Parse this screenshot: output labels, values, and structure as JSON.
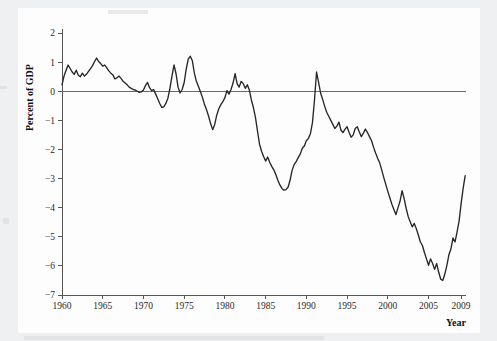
{
  "figure": {
    "background_color": "#eff0f1",
    "plot_background_color": "#fdfdfd",
    "line_color": "#262626",
    "axis_color": "#555555",
    "zero_line_color": "#6b6b6b",
    "text_color": "#1a1a1a"
  },
  "chart_data": {
    "type": "line",
    "title": "",
    "subtitle": "",
    "xlabel": "Year",
    "ylabel": "Percent of GDP",
    "xlim": [
      1960,
      2009.6
    ],
    "ylim": [
      -7,
      2
    ],
    "grid": false,
    "legend": null,
    "zero_reference_line": 0,
    "xticks": [
      1960,
      1965,
      1970,
      1975,
      1980,
      1985,
      1990,
      1995,
      2000,
      2005,
      2009
    ],
    "xtick_labels": [
      "1960",
      "1965",
      "1970",
      "1975",
      "1980",
      "1985",
      "1990",
      "1995",
      "2000",
      "2005",
      "2009"
    ],
    "yticks": [
      2,
      1,
      0,
      -1,
      -2,
      -3,
      -4,
      -5,
      -6,
      -7
    ],
    "ytick_labels": [
      "2",
      "1",
      "0",
      "−1",
      "−2",
      "−3",
      "−4",
      "−5",
      "−6",
      "−7"
    ],
    "series": [
      {
        "name": "Current account balance",
        "x": [
          1960.0,
          1960.25,
          1960.5,
          1960.75,
          1961.0,
          1961.25,
          1961.5,
          1961.75,
          1962.0,
          1962.25,
          1962.5,
          1962.75,
          1963.0,
          1963.25,
          1963.5,
          1963.75,
          1964.0,
          1964.25,
          1964.5,
          1964.75,
          1965.0,
          1965.25,
          1965.5,
          1965.75,
          1966.0,
          1966.25,
          1966.5,
          1966.75,
          1967.0,
          1967.25,
          1967.5,
          1967.75,
          1968.0,
          1968.25,
          1968.5,
          1968.75,
          1969.0,
          1969.25,
          1969.5,
          1969.75,
          1970.0,
          1970.25,
          1970.5,
          1970.75,
          1971.0,
          1971.25,
          1971.5,
          1971.75,
          1972.0,
          1972.25,
          1972.5,
          1972.75,
          1973.0,
          1973.25,
          1973.5,
          1973.75,
          1974.0,
          1974.25,
          1974.5,
          1974.75,
          1975.0,
          1975.25,
          1975.5,
          1975.75,
          1976.0,
          1976.25,
          1976.5,
          1976.75,
          1977.0,
          1977.25,
          1977.5,
          1977.75,
          1978.0,
          1978.25,
          1978.5,
          1978.75,
          1979.0,
          1979.25,
          1979.5,
          1979.75,
          1980.0,
          1980.25,
          1980.5,
          1980.75,
          1981.0,
          1981.25,
          1981.5,
          1981.75,
          1982.0,
          1982.25,
          1982.5,
          1982.75,
          1983.0,
          1983.25,
          1983.5,
          1983.75,
          1984.0,
          1984.25,
          1984.5,
          1984.75,
          1985.0,
          1985.25,
          1985.5,
          1985.75,
          1986.0,
          1986.25,
          1986.5,
          1986.75,
          1987.0,
          1987.25,
          1987.5,
          1987.75,
          1988.0,
          1988.25,
          1988.5,
          1988.75,
          1989.0,
          1989.25,
          1989.5,
          1989.75,
          1990.0,
          1990.25,
          1990.5,
          1990.75,
          1991.0,
          1991.25,
          1991.5,
          1991.75,
          1992.0,
          1992.25,
          1992.5,
          1992.75,
          1993.0,
          1993.25,
          1993.5,
          1993.75,
          1994.0,
          1994.25,
          1994.5,
          1994.75,
          1995.0,
          1995.25,
          1995.5,
          1995.75,
          1996.0,
          1996.25,
          1996.5,
          1996.75,
          1997.0,
          1997.25,
          1997.5,
          1997.75,
          1998.0,
          1998.25,
          1998.5,
          1998.75,
          1999.0,
          1999.25,
          1999.5,
          1999.75,
          2000.0,
          2000.25,
          2000.5,
          2000.75,
          2001.0,
          2001.25,
          2001.5,
          2001.75,
          2002.0,
          2002.25,
          2002.5,
          2002.75,
          2003.0,
          2003.25,
          2003.5,
          2003.75,
          2004.0,
          2004.25,
          2004.5,
          2004.75,
          2005.0,
          2005.25,
          2005.5,
          2005.75,
          2006.0,
          2006.25,
          2006.5,
          2006.75,
          2007.0,
          2007.25,
          2007.5,
          2007.75,
          2008.0,
          2008.25,
          2008.5,
          2008.75,
          2009.0,
          2009.25,
          2009.5
        ],
        "y": [
          0.22,
          0.52,
          0.72,
          0.9,
          0.78,
          0.66,
          0.58,
          0.72,
          0.55,
          0.5,
          0.62,
          0.52,
          0.58,
          0.68,
          0.78,
          0.88,
          1.02,
          1.14,
          1.02,
          0.95,
          0.86,
          0.9,
          0.8,
          0.7,
          0.62,
          0.56,
          0.42,
          0.46,
          0.52,
          0.44,
          0.34,
          0.28,
          0.22,
          0.14,
          0.1,
          0.06,
          0.04,
          0.0,
          -0.04,
          -0.02,
          0.04,
          0.2,
          0.3,
          0.12,
          0.02,
          0.06,
          -0.1,
          -0.26,
          -0.42,
          -0.56,
          -0.54,
          -0.42,
          -0.24,
          0.1,
          0.52,
          0.9,
          0.6,
          0.14,
          -0.06,
          0.06,
          0.3,
          0.76,
          1.1,
          1.2,
          1.05,
          0.62,
          0.34,
          0.16,
          -0.02,
          -0.22,
          -0.46,
          -0.64,
          -0.86,
          -1.12,
          -1.32,
          -1.14,
          -0.82,
          -0.6,
          -0.46,
          -0.36,
          -0.22,
          0.02,
          -0.1,
          0.06,
          0.28,
          0.6,
          0.26,
          0.14,
          0.34,
          0.26,
          0.1,
          0.22,
          0.04,
          -0.3,
          -0.56,
          -0.9,
          -1.36,
          -1.82,
          -2.06,
          -2.24,
          -2.4,
          -2.26,
          -2.44,
          -2.58,
          -2.7,
          -2.86,
          -3.06,
          -3.22,
          -3.34,
          -3.4,
          -3.38,
          -3.3,
          -3.06,
          -2.72,
          -2.52,
          -2.42,
          -2.28,
          -2.16,
          -1.96,
          -1.88,
          -1.7,
          -1.62,
          -1.46,
          -1.08,
          -0.3,
          0.66,
          0.3,
          -0.06,
          -0.28,
          -0.52,
          -0.72,
          -0.86,
          -1.0,
          -1.14,
          -1.28,
          -1.2,
          -1.06,
          -1.34,
          -1.42,
          -1.3,
          -1.22,
          -1.42,
          -1.58,
          -1.5,
          -1.28,
          -1.22,
          -1.4,
          -1.56,
          -1.44,
          -1.3,
          -1.42,
          -1.56,
          -1.7,
          -1.92,
          -2.12,
          -2.3,
          -2.46,
          -2.7,
          -2.96,
          -3.2,
          -3.44,
          -3.66,
          -3.88,
          -4.06,
          -4.24,
          -4.0,
          -3.78,
          -3.42,
          -3.68,
          -4.02,
          -4.3,
          -4.48,
          -4.66,
          -4.54,
          -4.72,
          -4.94,
          -5.18,
          -5.3,
          -5.54,
          -5.76,
          -5.98,
          -5.76,
          -5.92,
          -6.12,
          -5.92,
          -6.22,
          -6.46,
          -6.5,
          -6.28,
          -5.98,
          -5.62,
          -5.42,
          -5.04,
          -5.18,
          -4.84,
          -4.46,
          -3.86,
          -3.34,
          -2.9
        ]
      }
    ]
  },
  "axes": {
    "y_axis_label": "Percent of GDP",
    "x_axis_label": "Year"
  }
}
